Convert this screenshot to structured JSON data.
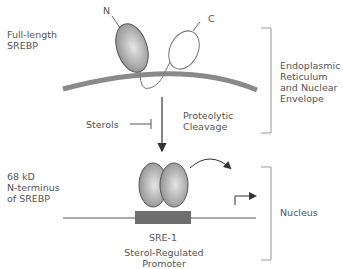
{
  "diagram": {
    "type": "biological pathway",
    "labels": {
      "full_length": "Full-length\nSREBP",
      "n_term": "N",
      "c_term": "C",
      "er_region": "Endoplasmic\nReticulum\nand Nuclear\nEnvelope",
      "sterols": "Sterols",
      "cleavage": "Proteolytic\nCleavage",
      "fragment": "68 kD\nN-terminus\nof SREBP",
      "sre": "SRE-1",
      "promoter": "Sterol-Regulated\nPromoter",
      "nucleus": "Nucleus"
    },
    "colors": {
      "protein_fill": "#a8a8a8",
      "membrane": "#8a8a8a",
      "line": "#555555",
      "box": "#6e6e6e",
      "text": "#555555"
    }
  }
}
